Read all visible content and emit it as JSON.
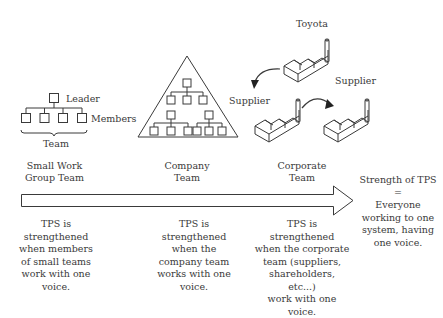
{
  "small_team": {
    "leader_label": "Leader",
    "members_label": "Members",
    "team_label": "Team",
    "title": [
      "Small Work",
      "Group Team"
    ],
    "description": [
      "TPS is",
      "strengthened",
      "when members",
      "of small teams",
      "work with one",
      "voice."
    ]
  },
  "company_team": {
    "title": [
      "Company",
      "Team"
    ],
    "description": [
      "TPS is",
      "strengthened",
      "when the",
      "company team",
      "works with one",
      "voice."
    ]
  },
  "corporate_team": {
    "toyota_label": "Toyota",
    "supplier_left_label": "Supplier",
    "supplier_right_label": "Supplier",
    "title": [
      "Corporate",
      "Team"
    ],
    "description": [
      "TPS is strengthened",
      "when the corporate",
      "team (suppliers,",
      "shareholders, etc...)",
      "work with one voice."
    ]
  },
  "strength": {
    "lines": [
      "Strength of TPS",
      "=",
      "Everyone",
      "working to one",
      "system, having",
      "one voice."
    ]
  },
  "colors": {
    "stroke": "#3a3a3a",
    "background": "#ffffff"
  }
}
